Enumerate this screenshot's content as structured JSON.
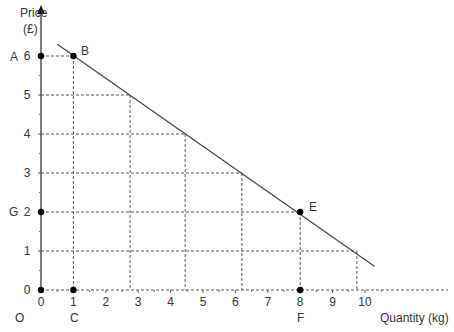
{
  "chart_data": {
    "type": "line",
    "title": "",
    "xlabel": "Quantity (kg)",
    "ylabel": "Price (£)",
    "ylabel_line1": "Price",
    "ylabel_line2": "(£)",
    "xlim": [
      0,
      11
    ],
    "ylim": [
      0,
      6.5
    ],
    "x_ticks": [
      "0",
      "1",
      "2",
      "3",
      "4",
      "5",
      "6",
      "7",
      "8",
      "9",
      "10"
    ],
    "y_ticks": [
      "0",
      "1",
      "2",
      "3",
      "4",
      "5",
      "6"
    ],
    "grid": false,
    "series": [
      {
        "name": "demand",
        "x": [
          0.5,
          10.3
        ],
        "y": [
          6.3,
          0.6
        ]
      }
    ],
    "dashed_guides": [
      {
        "x": 1,
        "y": 6
      },
      {
        "x": 2.75,
        "y": 5
      },
      {
        "x": 4.45,
        "y": 4
      },
      {
        "x": 6.2,
        "y": 3
      },
      {
        "x": 8,
        "y": 2
      },
      {
        "x": 9.75,
        "y": 1
      }
    ],
    "points": [
      {
        "label": "B",
        "x": 1,
        "y": 6
      },
      {
        "label": "E",
        "x": 8,
        "y": 2
      },
      {
        "label": "A",
        "x": 0,
        "y": 6
      },
      {
        "label": "G",
        "x": 0,
        "y": 2
      },
      {
        "label": "C",
        "x": 1,
        "y": 0
      },
      {
        "label": "F",
        "x": 8,
        "y": 0
      },
      {
        "label": "O",
        "x": 0,
        "y": 0
      }
    ]
  },
  "labels": {
    "A": "A",
    "B": "B",
    "C": "C",
    "E": "E",
    "F": "F",
    "G": "G",
    "O": "O"
  }
}
